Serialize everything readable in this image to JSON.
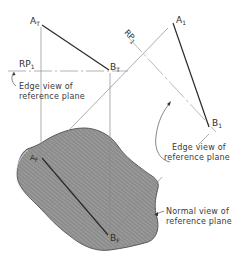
{
  "diagram": {
    "points": {
      "a_top": {
        "main": "A",
        "sub": "T"
      },
      "b_top": {
        "main": "B",
        "sub": "T"
      },
      "a_front": {
        "main": "A",
        "sub": "F"
      },
      "b_front": {
        "main": "B",
        "sub": "F"
      },
      "a_aux": {
        "main": "A",
        "sub": "1"
      },
      "b_aux": {
        "main": "B",
        "sub": "1"
      }
    },
    "reference_planes": {
      "rp_left": {
        "main": "RP",
        "sub": "1"
      },
      "rp_right": {
        "main": "RP",
        "sub": "1"
      }
    },
    "annotations": {
      "edge_view_left": {
        "line1": "Edge view of",
        "line2": "reference plane"
      },
      "edge_view_right": {
        "line1": "Edge view of",
        "line2": "reference plane"
      },
      "normal_view": {
        "line1": "Normal view of",
        "line2": "reference plane"
      }
    },
    "colors": {
      "line": "#2a2a2a",
      "thin_line": "#8a8a8a",
      "plane_fill": "#8c8c8c",
      "plane_hatch": "#a8a8a8",
      "background": "#ffffff"
    }
  }
}
